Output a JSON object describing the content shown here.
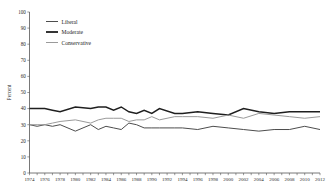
{
  "chart_data": {
    "type": "line",
    "title": "",
    "xlabel": "",
    "ylabel": "Percent",
    "ylim": [
      0,
      100
    ],
    "xlim": [
      1974,
      2012
    ],
    "ytick_step": 10,
    "xtick_step": 2,
    "grid": false,
    "legend_position": "top-left",
    "yticks": [
      "0",
      "10",
      "20",
      "30",
      "40",
      "50",
      "60",
      "70",
      "80",
      "90",
      "100"
    ],
    "x": [
      1974,
      1975,
      1976,
      1977,
      1978,
      1980,
      1982,
      1983,
      1984,
      1985,
      1986,
      1987,
      1988,
      1989,
      1990,
      1991,
      1993,
      1994,
      1996,
      1998,
      2000,
      2002,
      2004,
      2006,
      2008,
      2010,
      2012
    ],
    "xticks": [
      "1974",
      "1976",
      "1978",
      "1980",
      "1982",
      "1984",
      "1986",
      "1988",
      "1990",
      "1992",
      "1994",
      "1996",
      "1998",
      "2000",
      "2002",
      "2004",
      "2006",
      "2008",
      "2010",
      "2012"
    ],
    "series": [
      {
        "name": "Liberal",
        "color": "#4d4d4d",
        "width": 1.0,
        "values": [
          30,
          29,
          30,
          29,
          30,
          26,
          30,
          27,
          29,
          28,
          27,
          31,
          30,
          28,
          28,
          28,
          28,
          28,
          27,
          29,
          28,
          27,
          26,
          27,
          27,
          29,
          27
        ]
      },
      {
        "name": "Moderate",
        "color": "#1f1f1f",
        "width": 1.5,
        "values": [
          40,
          40,
          40,
          39,
          38,
          41,
          40,
          41,
          41,
          39,
          41,
          38,
          37,
          39,
          37,
          40,
          37,
          37,
          38,
          37,
          36,
          40,
          38,
          37,
          38,
          38,
          38
        ]
      },
      {
        "name": "Conservative",
        "color": "#9a9a9a",
        "width": 1.0,
        "values": [
          30,
          30,
          30,
          31,
          32,
          33,
          31,
          33,
          34,
          34,
          34,
          32,
          33,
          33,
          35,
          33,
          35,
          35,
          35,
          34,
          36,
          34,
          37,
          36,
          35,
          34,
          35
        ]
      }
    ],
    "legend": [
      {
        "label": "Liberal",
        "color": "#4d4d4d",
        "width": 1.0
      },
      {
        "label": "Moderate",
        "color": "#1f1f1f",
        "width": 1.8
      },
      {
        "label": "Conservative",
        "color": "#9a9a9a",
        "width": 1.0
      }
    ]
  }
}
